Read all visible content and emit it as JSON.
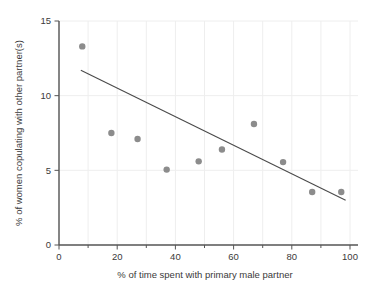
{
  "chart_data": {
    "type": "scatter",
    "title": "",
    "xlabel": "% of time spent with primary male partner",
    "ylabel": "% of women copulating with other partner(s)",
    "xlim": [
      0,
      100
    ],
    "ylim": [
      0,
      15
    ],
    "xticks": [
      0,
      20,
      40,
      60,
      80,
      100
    ],
    "yticks": [
      0,
      5,
      10,
      15
    ],
    "xtick_labels": [
      "0",
      "20",
      "40",
      "60",
      "80",
      "100"
    ],
    "ytick_labels": [
      "0",
      "5",
      "10",
      "15"
    ],
    "grid": true,
    "grid_x_minor_step": 10,
    "legend": "none",
    "point_color": "#8c8c8c",
    "line_color": "#4a4a4a",
    "axis_color": "#555555",
    "grid_color": "#eeeeee",
    "points": [
      {
        "x": 8,
        "y": 13.3
      },
      {
        "x": 18,
        "y": 7.5
      },
      {
        "x": 27,
        "y": 7.1
      },
      {
        "x": 37,
        "y": 5.05
      },
      {
        "x": 48,
        "y": 5.6
      },
      {
        "x": 56,
        "y": 6.4
      },
      {
        "x": 67,
        "y": 8.1
      },
      {
        "x": 77,
        "y": 5.55
      },
      {
        "x": 87,
        "y": 3.55
      },
      {
        "x": 97,
        "y": 3.55
      }
    ],
    "trendline": {
      "x1": 7.5,
      "y1": 11.7,
      "x2": 98.5,
      "y2": 3.0
    }
  }
}
